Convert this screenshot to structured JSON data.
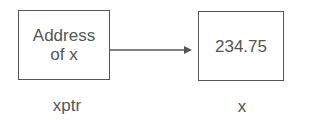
{
  "nodes": [
    {
      "id": "xptr",
      "content_lines": [
        "Address",
        "of x"
      ],
      "label": "xptr"
    },
    {
      "id": "x",
      "content": "234.75",
      "label": "x"
    }
  ],
  "edges": [
    {
      "from": "xptr",
      "to": "x",
      "type": "arrow"
    }
  ]
}
